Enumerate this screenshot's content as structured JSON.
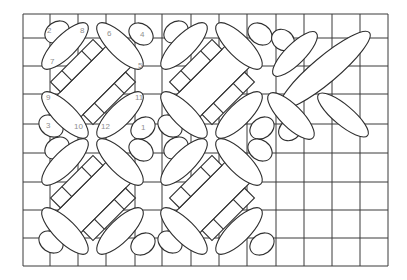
{
  "diagram": {
    "type": "stitch-chart",
    "colors": {
      "background": "#ffffff",
      "lines": "#2e2e2e",
      "grid": "#3a3a3a",
      "labels": "#8f8f8f"
    },
    "grid": {
      "left": 23,
      "top": 14,
      "right": 388,
      "bottom": 266,
      "columns_x": [
        23,
        50,
        78,
        106,
        135,
        162,
        191,
        219,
        247,
        276,
        304,
        332,
        360,
        388
      ],
      "rows_y": [
        14,
        38,
        66,
        94,
        124,
        153,
        182,
        210,
        238,
        266
      ]
    },
    "stitch_order_labels": [
      {
        "text": "2",
        "x": 47,
        "y": 33
      },
      {
        "text": "8",
        "x": 80,
        "y": 33
      },
      {
        "text": "6",
        "x": 107,
        "y": 36
      },
      {
        "text": "4",
        "x": 140,
        "y": 37
      },
      {
        "text": "7",
        "x": 50,
        "y": 64
      },
      {
        "text": "5",
        "x": 138,
        "y": 68
      },
      {
        "text": "9",
        "x": 46,
        "y": 100
      },
      {
        "text": "11",
        "x": 135,
        "y": 100
      },
      {
        "text": "3",
        "x": 46,
        "y": 128
      },
      {
        "text": "10",
        "x": 74,
        "y": 129
      },
      {
        "text": "12",
        "x": 101,
        "y": 129
      },
      {
        "text": "1",
        "x": 141,
        "y": 130
      }
    ],
    "motifs": [
      {
        "name": "motif-top-left",
        "cx": 93,
        "cy": 82
      },
      {
        "name": "motif-top-center",
        "cx": 212,
        "cy": 82
      },
      {
        "name": "motif-bottom-left",
        "cx": 93,
        "cy": 198
      },
      {
        "name": "motif-bottom-center",
        "cx": 212,
        "cy": 198
      }
    ]
  }
}
